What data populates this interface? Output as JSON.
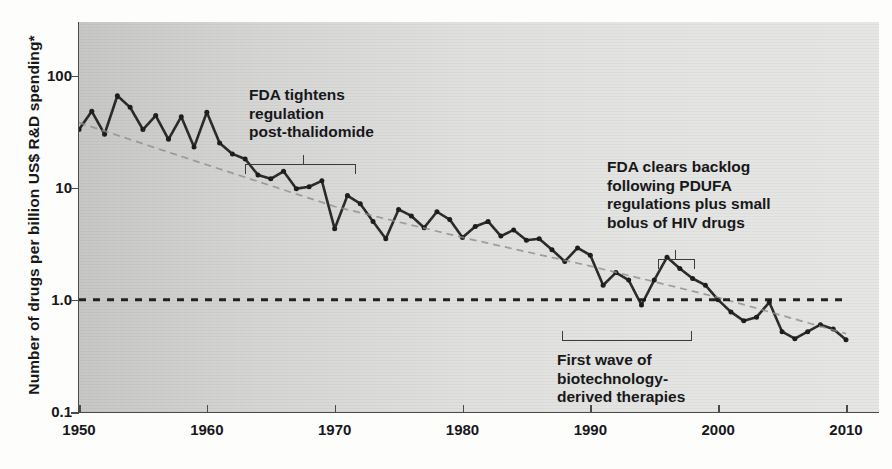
{
  "chart_data": {
    "type": "line",
    "title": "",
    "subtitle": "",
    "xlabel": "",
    "ylabel": "Number of drugs per billion US$ R&D spending*",
    "yscale": "log",
    "ylim": [
      0.1,
      300
    ],
    "xlim": [
      1950,
      2010
    ],
    "grid": false,
    "legend": null,
    "yticks": [
      {
        "value": 100,
        "label": "100"
      },
      {
        "value": 10,
        "label": "10"
      },
      {
        "value": 1.0,
        "label": "1.0"
      },
      {
        "value": 0.1,
        "label": "0.1"
      }
    ],
    "xticks": [
      {
        "value": 1950,
        "label": "1950"
      },
      {
        "value": 1960,
        "label": "1960"
      },
      {
        "value": 1970,
        "label": "1970"
      },
      {
        "value": 1980,
        "label": "1980"
      },
      {
        "value": 1990,
        "label": "1990"
      },
      {
        "value": 2000,
        "label": "2000"
      },
      {
        "value": 2010,
        "label": "2010"
      }
    ],
    "series": [
      {
        "name": "Number of drugs per billion US$ R&D spending",
        "style": "solid-with-markers",
        "color": "#1c1c1c",
        "x": [
          1950,
          1951,
          1952,
          1953,
          1954,
          1955,
          1956,
          1957,
          1958,
          1959,
          1960,
          1961,
          1962,
          1963,
          1964,
          1965,
          1966,
          1967,
          1968,
          1969,
          1970,
          1971,
          1972,
          1973,
          1974,
          1975,
          1976,
          1977,
          1978,
          1979,
          1980,
          1981,
          1982,
          1983,
          1984,
          1985,
          1986,
          1987,
          1988,
          1989,
          1990,
          1991,
          1992,
          1993,
          1994,
          1995,
          1996,
          1997,
          1998,
          1999,
          2000,
          2001,
          2002,
          2003,
          2004,
          2005,
          2006,
          2007,
          2008,
          2009,
          2010
        ],
        "values": [
          33,
          48,
          30,
          66,
          52,
          33,
          44,
          27,
          43,
          23,
          47,
          25,
          20,
          18,
          13,
          12,
          14,
          9.8,
          10.2,
          11.5,
          4.3,
          8.5,
          7.2,
          5.0,
          3.5,
          6.4,
          5.6,
          4.4,
          6.1,
          5.2,
          3.6,
          4.5,
          5.0,
          3.7,
          4.2,
          3.4,
          3.5,
          2.8,
          2.2,
          2.9,
          2.5,
          1.35,
          1.75,
          1.5,
          0.9,
          1.5,
          2.4,
          1.9,
          1.55,
          1.35,
          1.0,
          0.78,
          0.65,
          0.7,
          0.95,
          0.52,
          0.45,
          0.52,
          0.6,
          0.55,
          0.44
        ]
      },
      {
        "name": "Trend line",
        "style": "dashed-fine",
        "color": "#8d8d8d",
        "x": [
          1950,
          1960,
          1970,
          1980,
          1990,
          2000,
          2010
        ],
        "values": [
          38,
          16,
          6.8,
          3.6,
          2.0,
          1.05,
          0.5
        ]
      },
      {
        "name": "Reference line at 1.0",
        "style": "dashed-heavy",
        "color": "#111111",
        "x": [
          1950,
          2010
        ],
        "values": [
          1.0,
          1.0
        ]
      }
    ],
    "annotations": [
      {
        "id": "fda-tightens",
        "text": "FDA tightens\nregulation\npost-thalidomide",
        "bracket": {
          "type": "down",
          "x_start": 1963,
          "x_end": 1971.5,
          "stem_x": 1967.5
        }
      },
      {
        "id": "fda-backlog",
        "text": "FDA clears backlog\nfollowing PDUFA\nregulations plus small\nbolus of HIV drugs",
        "bracket": {
          "type": "down",
          "x_start": 1995.3,
          "x_end": 1998.0,
          "stem_x": 1996.6
        }
      },
      {
        "id": "biotech-wave",
        "text": "First wave of\nbiotechnology-\nderived therapies",
        "bracket": {
          "type": "up",
          "x_start": 1987.8,
          "x_end": 1997.8,
          "stem_x": null
        }
      }
    ]
  }
}
